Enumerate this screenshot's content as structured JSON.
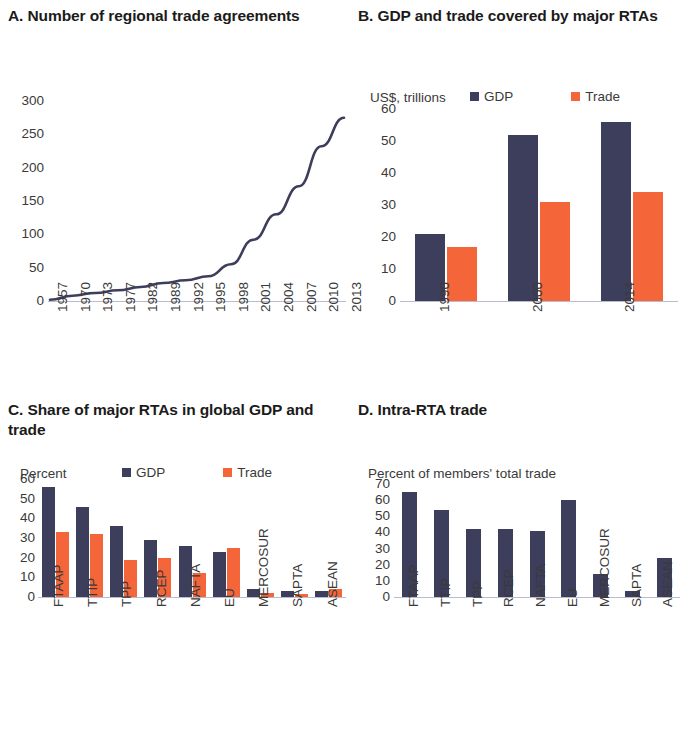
{
  "panels": {
    "a": {
      "title": "A. Number of regional trade agreements"
    },
    "b": {
      "title": "B. GDP and trade covered by major RTAs"
    },
    "c": {
      "title": "C. Share of major RTAs in global GDP and trade"
    },
    "d": {
      "title": "D. Intra-RTA trade"
    }
  },
  "legend": {
    "gdp_label": "GDP",
    "trade_label": "Trade",
    "gdp_color": "#3d3d5c",
    "trade_color": "#f4653a"
  },
  "chart_data": [
    {
      "id": "panel-a",
      "type": "line",
      "title": "A. Number of regional trade agreements",
      "xlabel": "",
      "ylabel": "",
      "ylim": [
        0,
        300
      ],
      "yticks": [
        0,
        50,
        100,
        150,
        200,
        250,
        300
      ],
      "grid": false,
      "legend_position": "none",
      "x": [
        "1957",
        "1970",
        "1973",
        "1977",
        "1982",
        "1989",
        "1992",
        "1995",
        "1998",
        "2001",
        "2004",
        "2007",
        "2010",
        "2013"
      ],
      "series": [
        {
          "name": "Number of regional trade agreements",
          "color": "#3d3d5c",
          "values": [
            2,
            8,
            12,
            16,
            21,
            27,
            31,
            37,
            55,
            92,
            130,
            172,
            232,
            275
          ]
        }
      ]
    },
    {
      "id": "panel-b",
      "type": "bar",
      "title": "B. GDP and trade covered by major RTAs",
      "subtitle": "US$, trillions",
      "xlabel": "",
      "ylabel": "US$, trillions",
      "ylim": [
        0,
        60
      ],
      "yticks": [
        0,
        10,
        20,
        30,
        40,
        50,
        60
      ],
      "grid": false,
      "legend_position": "top",
      "categories": [
        "1990",
        "2000",
        "2014"
      ],
      "series": [
        {
          "name": "GDP",
          "color": "#3d3d5c",
          "values": [
            21,
            52,
            56
          ]
        },
        {
          "name": "Trade",
          "color": "#f4653a",
          "values": [
            17,
            31,
            34
          ]
        }
      ]
    },
    {
      "id": "panel-c",
      "type": "bar",
      "title": "C. Share of major RTAs in global GDP and trade",
      "subtitle": "Percent",
      "xlabel": "",
      "ylabel": "Percent",
      "ylim": [
        0,
        60
      ],
      "yticks": [
        0,
        10,
        20,
        30,
        40,
        50,
        60
      ],
      "grid": false,
      "legend_position": "top",
      "categories": [
        "FTAAP",
        "TTIP",
        "TPP",
        "RCEP",
        "NAFTA",
        "EU",
        "MERCOSUR",
        "SAPTA",
        "ASEAN"
      ],
      "series": [
        {
          "name": "GDP",
          "color": "#3d3d5c",
          "values": [
            56,
            46,
            36,
            29,
            26,
            23,
            4,
            3,
            3
          ]
        },
        {
          "name": "Trade",
          "color": "#f4653a",
          "values": [
            33,
            32,
            19,
            20,
            12,
            25,
            2,
            1.5,
            4
          ]
        }
      ]
    },
    {
      "id": "panel-d",
      "type": "bar",
      "title": "D. Intra-RTA trade",
      "subtitle": "Percent of members' total trade",
      "xlabel": "",
      "ylabel": "Percent of members' total trade",
      "ylim": [
        0,
        70
      ],
      "yticks": [
        0,
        10,
        20,
        30,
        40,
        50,
        60,
        70
      ],
      "grid": false,
      "legend_position": "none",
      "categories": [
        "FTAAP",
        "TTIP",
        "TPP",
        "RCEP",
        "NAFTA",
        "EU",
        "MERCOSUR",
        "SAPTA",
        "ASEAN"
      ],
      "series": [
        {
          "name": "Intra-RTA trade",
          "color": "#3d3d5c",
          "values": [
            65,
            54,
            42,
            42,
            41,
            60,
            14,
            4,
            24
          ]
        }
      ]
    }
  ]
}
